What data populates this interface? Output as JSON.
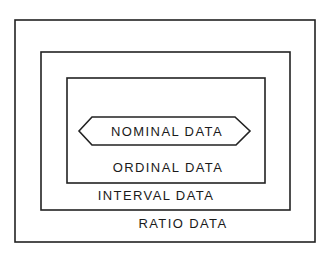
{
  "diagram": {
    "type": "nested-sets",
    "levels": [
      {
        "id": "ratio",
        "label": "RATIO DATA"
      },
      {
        "id": "interval",
        "label": "INTERVAL DATA"
      },
      {
        "id": "ordinal",
        "label": "ORDINAL DATA"
      },
      {
        "id": "nominal",
        "label": "NOMINAL DATA"
      }
    ]
  },
  "colors": {
    "stroke": "#222222",
    "background": "#ffffff"
  }
}
